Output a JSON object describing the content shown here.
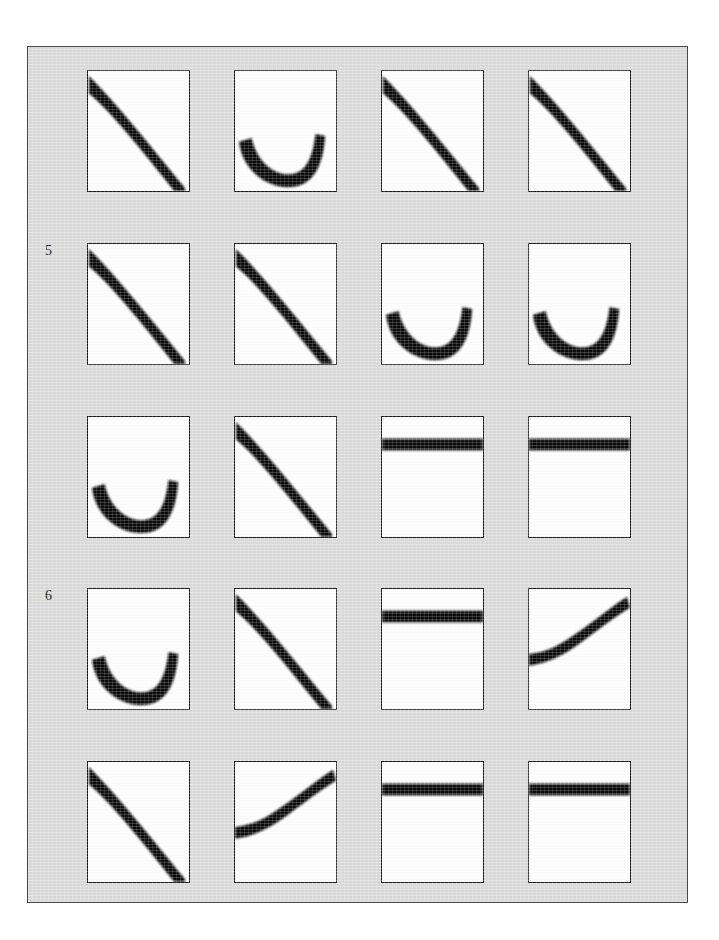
{
  "figure": {
    "background_color": "#dcdcdc",
    "page_color": "#ffffff",
    "frame_border_color": "#4a4a4a",
    "panel_border_color": "#202020",
    "panel_fill_color": "#ffffff",
    "curve_color": "#101010",
    "row_labels": [
      {
        "text": "5",
        "row_index": 1,
        "x": 44,
        "y": 243
      },
      {
        "text": "6",
        "row_index": 3,
        "x": 44,
        "y": 588
      }
    ]
  },
  "chart_data": {
    "type": "line",
    "title": "",
    "xlabel": "",
    "ylabel": "",
    "grid": false,
    "legend": "none",
    "layout": {
      "rows": 5,
      "cols": 4
    },
    "panels": [
      {
        "row": 0,
        "col": 0,
        "shape": "decreasing-convex-curve",
        "description": "thick band descending from upper-left to lower-right corner"
      },
      {
        "row": 0,
        "col": 1,
        "shape": "u-shaped-curve",
        "description": "thick U band, open upward, minimum near lower-center"
      },
      {
        "row": 0,
        "col": 2,
        "shape": "decreasing-convex-curve",
        "description": "thick band descending from upper-left to lower-right corner"
      },
      {
        "row": 0,
        "col": 3,
        "shape": "decreasing-convex-curve",
        "description": "thick band descending from upper-left to lower-right corner"
      },
      {
        "row": 1,
        "col": 0,
        "shape": "decreasing-convex-curve",
        "description": "thick band descending from upper-left to lower-right corner"
      },
      {
        "row": 1,
        "col": 1,
        "shape": "decreasing-convex-curve",
        "description": "thick band descending from upper-left to lower-right corner"
      },
      {
        "row": 1,
        "col": 2,
        "shape": "u-shaped-curve",
        "description": "thick U band, open upward, minimum near lower-center"
      },
      {
        "row": 1,
        "col": 3,
        "shape": "u-shaped-curve",
        "description": "thick U band, open upward, minimum near lower-center"
      },
      {
        "row": 2,
        "col": 0,
        "shape": "u-shaped-curve",
        "description": "thick U band, open upward, minimum near lower-center"
      },
      {
        "row": 2,
        "col": 1,
        "shape": "decreasing-convex-curve",
        "description": "thick band descending from upper-left to lower-right corner"
      },
      {
        "row": 2,
        "col": 2,
        "shape": "horizontal-bar",
        "description": "thick flat horizontal band near the top of the panel"
      },
      {
        "row": 2,
        "col": 3,
        "shape": "horizontal-bar",
        "description": "thick flat horizontal band near the top of the panel"
      },
      {
        "row": 3,
        "col": 0,
        "shape": "u-shaped-curve",
        "description": "thick U band, open upward, minimum near lower-center"
      },
      {
        "row": 3,
        "col": 1,
        "shape": "decreasing-convex-curve",
        "description": "thick band descending from upper-left to lower-right corner"
      },
      {
        "row": 3,
        "col": 2,
        "shape": "horizontal-bar",
        "description": "thick flat horizontal band near the top of the panel"
      },
      {
        "row": 3,
        "col": 3,
        "shape": "rising-s-curve",
        "description": "thick band flat on the left then rising to the upper-right corner"
      },
      {
        "row": 4,
        "col": 0,
        "shape": "decreasing-convex-curve",
        "description": "thick band descending from upper-left to lower-right corner"
      },
      {
        "row": 4,
        "col": 1,
        "shape": "rising-s-curve",
        "description": "thick band flat on the left then rising to the upper-right corner"
      },
      {
        "row": 4,
        "col": 2,
        "shape": "horizontal-bar",
        "description": "thick flat horizontal band near the top of the panel"
      },
      {
        "row": 4,
        "col": 3,
        "shape": "horizontal-bar",
        "description": "thick flat horizontal band near the top of the panel"
      }
    ]
  }
}
